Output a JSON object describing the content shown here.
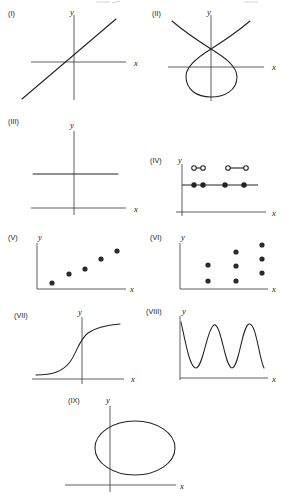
{
  "figure": {
    "width": 287,
    "height": 500,
    "background_color": "#ffffff",
    "ink_color": "#232323",
    "axis_color": "#2b2b2b"
  },
  "panels": [
    {
      "tag": "(I)",
      "tag_pos": [
        8,
        16
      ],
      "x_label": "x",
      "y_label": "y",
      "x_label_pos": [
        134,
        66
      ],
      "y_label_pos": [
        70,
        15
      ],
      "origin": [
        74,
        62
      ],
      "x_axis": [
        31,
        126
      ],
      "y_axis": [
        15,
        100
      ],
      "graph_type": "line",
      "description": "straight line with positive slope through the axes",
      "line": {
        "x1": 22,
        "y1": 99,
        "x2": 116,
        "y2": 19
      }
    },
    {
      "tag": "(II)",
      "tag_pos": [
        152,
        16
      ],
      "x_label": "x",
      "y_label": "y",
      "x_label_pos": [
        272,
        67
      ],
      "y_label_pos": [
        207,
        15
      ],
      "origin": [
        211,
        67
      ],
      "x_axis": [
        168,
        264
      ],
      "y_axis": [
        15,
        101
      ],
      "graph_type": "alpha-curve",
      "description": "loop with crossing node above x-axis and two branches rising outward",
      "node": [
        211,
        49
      ]
    },
    {
      "tag": "(III)",
      "tag_pos": [
        8,
        124
      ],
      "x_label": "x",
      "y_label": "y",
      "x_label_pos": [
        134,
        212
      ],
      "y_label_pos": [
        70,
        124
      ],
      "origin": [
        74,
        208
      ],
      "x_axis": [
        31,
        126
      ],
      "y_axis": [
        131,
        215
      ],
      "graph_type": "horizontal-line",
      "description": "horizontal line above and parallel to the x-axis",
      "line": {
        "x1": 33,
        "y1": 174,
        "x2": 118,
        "y2": 174
      }
    },
    {
      "tag": "(IV)",
      "tag_pos": [
        150,
        160
      ],
      "x_label": "x",
      "y_label": "y",
      "x_label_pos": [
        272,
        213
      ],
      "y_label_pos": [
        178,
        160
      ],
      "origin": [
        182,
        185
      ],
      "x_axis": [
        176,
        266
      ],
      "y_axis": [
        164,
        216
      ],
      "graph_type": "step-segments",
      "description": "piecewise step function: lower segments with filled endpoints on one level and upper segments with open endpoints",
      "lower_segments": [
        {
          "x1": 182,
          "x2": 202,
          "y": 185,
          "left_end": "closed",
          "right_end": "closed"
        },
        {
          "x1": 205,
          "x2": 229,
          "y": 185,
          "left_end": "closed",
          "right_end": "closed"
        },
        {
          "x1": 232,
          "x2": 258,
          "y": 185,
          "left_end": "closed",
          "right_end": "open"
        }
      ],
      "lower_dots": [
        {
          "x": 194,
          "y": 185,
          "style": "filled"
        },
        {
          "x": 203,
          "y": 185,
          "style": "filled"
        },
        {
          "x": 225,
          "y": 185,
          "style": "filled"
        },
        {
          "x": 244,
          "y": 185,
          "style": "filled"
        }
      ],
      "upper_segments": [
        {
          "x1": 194,
          "x2": 203,
          "y": 168
        },
        {
          "x1": 228,
          "x2": 246,
          "y": 168
        }
      ],
      "upper_dots": [
        {
          "x": 194,
          "y": 168,
          "style": "open"
        },
        {
          "x": 203,
          "y": 168,
          "style": "open"
        },
        {
          "x": 228,
          "y": 168,
          "style": "open"
        },
        {
          "x": 246,
          "y": 168,
          "style": "open"
        }
      ]
    },
    {
      "tag": "(V)",
      "tag_pos": [
        8,
        236
      ],
      "x_label": "x",
      "y_label": "y",
      "x_label_pos": [
        132,
        292
      ],
      "y_label_pos": [
        40,
        236
      ],
      "origin": [
        37,
        289
      ],
      "x_axis": [
        37,
        126
      ],
      "y_axis": [
        240,
        289
      ],
      "graph_type": "scatter",
      "description": "five points rising from lower-left to upper-right",
      "points": [
        {
          "x": 52,
          "y": 283
        },
        {
          "x": 69,
          "y": 275
        },
        {
          "x": 85,
          "y": 269
        },
        {
          "x": 101,
          "y": 259
        },
        {
          "x": 117,
          "y": 251
        }
      ]
    },
    {
      "tag": "(VI)",
      "tag_pos": [
        150,
        236
      ],
      "x_label": "x",
      "y_label": "y",
      "x_label_pos": [
        272,
        292
      ],
      "y_label_pos": [
        182,
        236
      ],
      "origin": [
        180,
        289
      ],
      "x_axis": [
        180,
        268
      ],
      "y_axis": [
        240,
        289
      ],
      "graph_type": "scatter",
      "description": "three vertical columns of points, two in the first column, three in each of the others",
      "points": [
        {
          "x": 208,
          "y": 265
        },
        {
          "x": 208,
          "y": 281
        },
        {
          "x": 236,
          "y": 252
        },
        {
          "x": 236,
          "y": 266
        },
        {
          "x": 236,
          "y": 281
        },
        {
          "x": 262,
          "y": 245
        },
        {
          "x": 262,
          "y": 259
        },
        {
          "x": 262,
          "y": 273
        }
      ]
    },
    {
      "tag": "(VII)",
      "tag_pos": [
        14,
        314
      ],
      "x_label": "x",
      "y_label": "y",
      "x_label_pos": [
        133,
        381
      ],
      "y_label_pos": [
        78,
        311
      ],
      "origin": [
        82,
        379
      ],
      "x_axis": [
        32,
        124
      ],
      "y_axis": [
        317,
        384
      ],
      "graph_type": "sigmoid",
      "description": "S-shaped increasing curve flattening at both ends"
    },
    {
      "tag": "(VIII)",
      "tag_pos": [
        148,
        309
      ],
      "x_label": "x",
      "y_label": "y",
      "x_label_pos": [
        272,
        381
      ],
      "y_label_pos": [
        182,
        311
      ],
      "origin": [
        180,
        378
      ],
      "x_axis": [
        180,
        268
      ],
      "y_axis": [
        316,
        380
      ],
      "graph_type": "sinusoid",
      "description": "periodic oscillating wave with about three crests",
      "cycles": 2.75,
      "crest_y": 324,
      "trough_y": 368
    },
    {
      "tag": "(IX)",
      "tag_pos": [
        68,
        399
      ],
      "x_label": "x",
      "y_label": "y",
      "x_label_pos": [
        182,
        489
      ],
      "y_label_pos": [
        106,
        399
      ],
      "origin": [
        110,
        485
      ],
      "x_axis": [
        65,
        176
      ],
      "y_axis": [
        406,
        492
      ],
      "graph_type": "ellipse",
      "description": "closed oval above the x-axis crossed by the y-axis",
      "ellipse": {
        "cx": 135,
        "cy": 448,
        "rx": 40,
        "ry": 27
      }
    }
  ]
}
